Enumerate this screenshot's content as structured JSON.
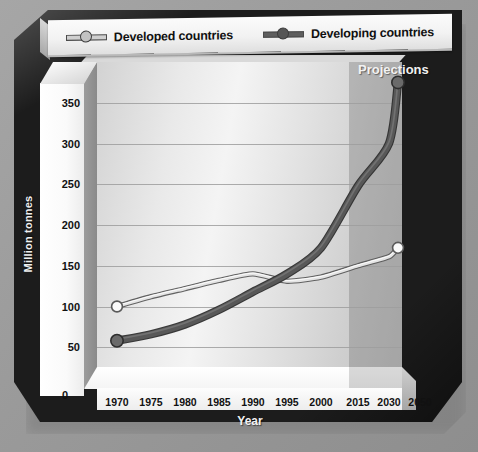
{
  "chart_data": {
    "type": "line",
    "title": "",
    "xlabel": "Year",
    "ylabel": "Million tonnes",
    "categories": [
      "1970",
      "1975",
      "1980",
      "1985",
      "1990",
      "1995",
      "2000",
      "2015",
      "2030",
      "2050"
    ],
    "ylim": [
      0,
      400
    ],
    "yticks": [
      0,
      50,
      100,
      150,
      200,
      250,
      300,
      350
    ],
    "grid": true,
    "legend_position": "top",
    "annotations": [
      "Projections"
    ],
    "series": [
      {
        "name": "Developed countries",
        "color": "#d9d9d9",
        "line_color": "#8f8f8f",
        "values": [
          100,
          112,
          122,
          132,
          140,
          131,
          136,
          150,
          161,
          172
        ]
      },
      {
        "name": "Developing countries",
        "color": "#5a5a5a",
        "line_color": "#4a4a4a",
        "values": [
          58,
          66,
          78,
          96,
          118,
          140,
          172,
          248,
          300,
          375
        ]
      }
    ]
  },
  "legend": {
    "items": [
      {
        "label": "Developed countries",
        "swatch": "#cfcfcf",
        "marker": "#c6c6c6"
      },
      {
        "label": "Developing countries",
        "swatch": "#5e5e5e",
        "marker": "#565656"
      }
    ]
  },
  "axes": {
    "y_title": "Million tonnes",
    "x_title": "Year",
    "y_ticks": [
      "350",
      "300",
      "250",
      "200",
      "150",
      "100",
      "50",
      "0"
    ],
    "y_zero": "0",
    "x_ticks": [
      "1970",
      "1975",
      "1980",
      "1985",
      "1990",
      "1995",
      "2000",
      "2015",
      "2030",
      "2050"
    ]
  },
  "annotations": {
    "projections": "Projections"
  },
  "colors": {
    "frame": "#1c1c1c",
    "backdrop": "#9c9c9c",
    "wall_light": "#f4f4f4",
    "projection_overlay": "#606060",
    "developed": "#d2d2d2",
    "developing": "#555555"
  }
}
